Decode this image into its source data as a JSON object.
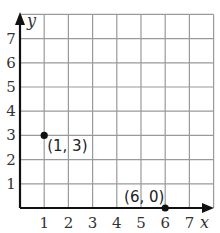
{
  "chart_data": {
    "type": "scatter",
    "title": "",
    "xlabel": "x",
    "ylabel": "y",
    "xlim": [
      0,
      8
    ],
    "ylim": [
      0,
      8
    ],
    "grid": true,
    "x_ticks": [
      "1",
      "2",
      "3",
      "4",
      "5",
      "6",
      "7"
    ],
    "y_ticks": [
      "1",
      "2",
      "3",
      "4",
      "5",
      "6",
      "7"
    ],
    "points": [
      {
        "x": 1,
        "y": 3,
        "label": "(1, 3)"
      },
      {
        "x": 6,
        "y": 0,
        "label": "(6, 0)"
      }
    ],
    "colors": {
      "grid": "#9a9a9a",
      "axis": "#111111",
      "point": "#111111"
    }
  }
}
